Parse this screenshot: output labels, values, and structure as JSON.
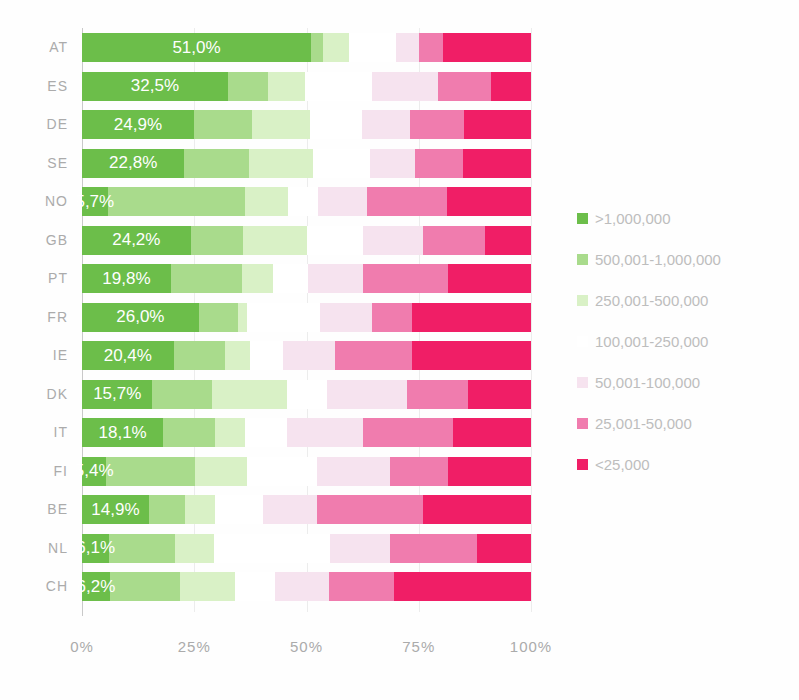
{
  "chart_data": {
    "type": "bar",
    "stacked": true,
    "orientation": "horizontal",
    "title": "",
    "xlabel": "",
    "ylabel": "",
    "xlim": [
      0,
      100
    ],
    "x_ticks": [
      "0%",
      "25%",
      "50%",
      "75%",
      "100%"
    ],
    "grid": "vertical-faint",
    "legend_position": "right",
    "series_names": [
      ">1,000,000",
      "500,001-1,000,000",
      "250,001-500,000",
      "100,001-250,000",
      "50,001-100,000",
      "25,001-50,000",
      "<25,000"
    ],
    "series_colors": [
      "#6cbe4a",
      "#a9db8c",
      "#d9f1c6",
      "#ffffff",
      "#f6e3ef",
      "#f07cae",
      "#f01e66"
    ],
    "categories": [
      "AT",
      "ES",
      "DE",
      "SE",
      "NO",
      "GB",
      "PT",
      "FR",
      "IE",
      "DK",
      "IT",
      "FI",
      "BE",
      "NL",
      "CH"
    ],
    "rows": [
      {
        "country": "AT",
        "value_label": "51,0%",
        "values": [
          51.0,
          2.7,
          5.8,
          10.5,
          5.1,
          5.3,
          19.6
        ]
      },
      {
        "country": "ES",
        "value_label": "32,5%",
        "values": [
          32.5,
          8.9,
          8.2,
          15.1,
          14.5,
          12.0,
          8.8
        ]
      },
      {
        "country": "DE",
        "value_label": "24,9%",
        "values": [
          24.9,
          12.9,
          12.9,
          11.6,
          10.7,
          12.2,
          14.8
        ]
      },
      {
        "country": "SE",
        "value_label": "22,8%",
        "values": [
          22.8,
          14.3,
          14.4,
          12.7,
          10.0,
          10.7,
          15.1
        ]
      },
      {
        "country": "NO",
        "value_label": "5,7%",
        "values": [
          5.7,
          30.6,
          9.6,
          6.7,
          10.9,
          17.8,
          18.7
        ]
      },
      {
        "country": "GB",
        "value_label": "24,2%",
        "values": [
          24.2,
          11.6,
          14.3,
          12.5,
          13.4,
          13.8,
          10.2
        ]
      },
      {
        "country": "PT",
        "value_label": "19,8%",
        "values": [
          19.8,
          15.8,
          6.9,
          7.8,
          12.3,
          18.9,
          18.5
        ]
      },
      {
        "country": "FR",
        "value_label": "26,0%",
        "values": [
          26.0,
          8.7,
          2.0,
          16.3,
          11.6,
          8.9,
          26.5
        ]
      },
      {
        "country": "IE",
        "value_label": "20,4%",
        "values": [
          20.4,
          11.4,
          5.6,
          7.4,
          11.6,
          17.1,
          26.5
        ]
      },
      {
        "country": "DK",
        "value_label": "15,7%",
        "values": [
          15.7,
          13.3,
          16.7,
          8.9,
          17.8,
          13.6,
          14.0
        ]
      },
      {
        "country": "IT",
        "value_label": "18,1%",
        "values": [
          18.1,
          11.6,
          6.7,
          9.3,
          16.9,
          20.0,
          17.4
        ]
      },
      {
        "country": "FI",
        "value_label": "5,4%",
        "values": [
          5.4,
          19.8,
          11.6,
          15.5,
          16.3,
          12.9,
          18.5
        ]
      },
      {
        "country": "BE",
        "value_label": "14,9%",
        "values": [
          14.9,
          8.0,
          6.7,
          10.7,
          12.0,
          23.6,
          24.1
        ]
      },
      {
        "country": "NL",
        "value_label": "6,1%",
        "values": [
          6.1,
          14.7,
          8.5,
          25.9,
          13.4,
          19.4,
          12.0
        ]
      },
      {
        "country": "CH",
        "value_label": "6,2%",
        "values": [
          6.2,
          15.6,
          12.2,
          8.9,
          12.2,
          14.5,
          30.4
        ]
      }
    ]
  },
  "legend": {
    "items": [
      {
        "label": ">1,000,000",
        "color": "#6cbe4a"
      },
      {
        "label": "500,001-1,000,000",
        "color": "#a9db8c"
      },
      {
        "label": "250,001-500,000",
        "color": "#d9f1c6"
      },
      {
        "label": "100,001-250,000",
        "color": "#ffffff"
      },
      {
        "label": "50,001-100,000",
        "color": "#f6e3ef"
      },
      {
        "label": "25,001-50,000",
        "color": "#f07cae"
      },
      {
        "label": "<25,000",
        "color": "#f01e66"
      }
    ]
  },
  "x_axis": {
    "ticks": [
      {
        "label": "0%",
        "pos": 0
      },
      {
        "label": "25%",
        "pos": 25
      },
      {
        "label": "50%",
        "pos": 50
      },
      {
        "label": "75%",
        "pos": 75
      },
      {
        "label": "100%",
        "pos": 100
      }
    ]
  }
}
